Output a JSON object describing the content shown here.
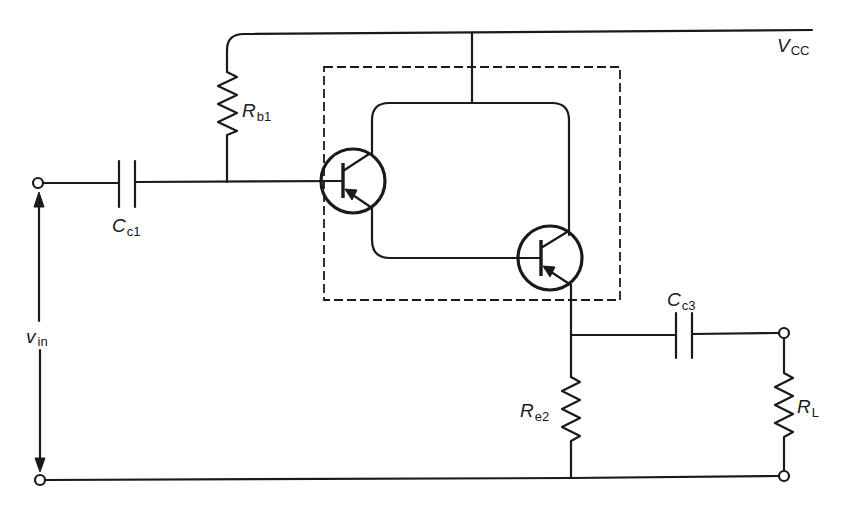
{
  "diagram": {
    "type": "circuit-schematic",
    "supply": {
      "main": "V",
      "sub": "CC"
    },
    "input": {
      "main": "v",
      "sub": "in"
    },
    "components": {
      "rb1": {
        "main": "R",
        "sub": "b1",
        "kind": "resistor"
      },
      "cc1": {
        "main": "C",
        "sub": "c1",
        "kind": "capacitor"
      },
      "cc3": {
        "main": "C",
        "sub": "c3",
        "kind": "capacitor"
      },
      "re2": {
        "main": "R",
        "sub": "e2",
        "kind": "resistor"
      },
      "rl": {
        "main": "R",
        "sub": "L",
        "kind": "resistor"
      },
      "q1": {
        "kind": "transistor",
        "label": ""
      },
      "q2": {
        "kind": "transistor",
        "label": ""
      }
    },
    "dashed_box": "darlington-pair-enclosure",
    "colors": {
      "ink": "#1a1a1a",
      "background": "#ffffff"
    }
  }
}
